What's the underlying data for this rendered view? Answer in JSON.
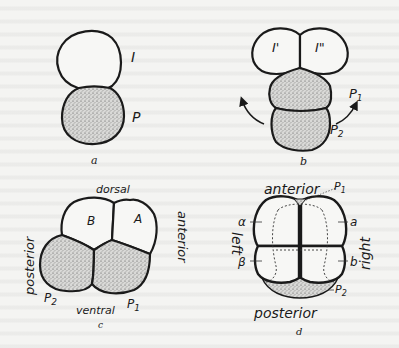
{
  "figure": {
    "panels": [
      {
        "id": "a",
        "caption": "a",
        "cells": [
          {
            "label": "I",
            "shaded": false
          },
          {
            "label": "P",
            "shaded": true
          }
        ]
      },
      {
        "id": "b",
        "caption": "b",
        "cells": [
          {
            "label": "I'",
            "shaded": false
          },
          {
            "label": "I\"",
            "shaded": false
          },
          {
            "label": "P1",
            "shaded": true
          },
          {
            "label": "P2",
            "shaded": true
          }
        ],
        "labels": {
          "p1": "P",
          "p1_sub": "1",
          "p2": "P",
          "p2_sub": "2"
        }
      },
      {
        "id": "c",
        "caption": "c",
        "cells": [
          {
            "label": "B",
            "shaded": false
          },
          {
            "label": "A",
            "shaded": false
          },
          {
            "label": "P2",
            "shaded": true
          },
          {
            "label": "P1",
            "shaded": true
          }
        ],
        "axes": {
          "top": "dorsal",
          "bottom": "ventral",
          "left": "posterior",
          "right": "anterior"
        },
        "labels": {
          "p2": "P",
          "p2_sub": "2",
          "p1": "P",
          "p1_sub": "1"
        }
      },
      {
        "id": "d",
        "caption": "d",
        "cells": [
          {
            "label": "α",
            "shaded": false
          },
          {
            "label": "a",
            "shaded": false
          },
          {
            "label": "β",
            "shaded": false
          },
          {
            "label": "b",
            "shaded": false
          },
          {
            "label": "P1",
            "shaded": true
          },
          {
            "label": "P2",
            "shaded": true
          }
        ],
        "axes": {
          "top": "anterior",
          "bottom": "posterior",
          "left": "left",
          "right": "right"
        },
        "labels": {
          "alpha": "α",
          "a": "a",
          "beta": "β",
          "b": "b",
          "p1": "P",
          "p1_sub": "1",
          "p2": "P",
          "p2_sub": "2"
        }
      }
    ]
  },
  "colors": {
    "ink": "#1a1a1a",
    "paper": "#f4f4f2",
    "stipple": "#bdbdbd"
  }
}
